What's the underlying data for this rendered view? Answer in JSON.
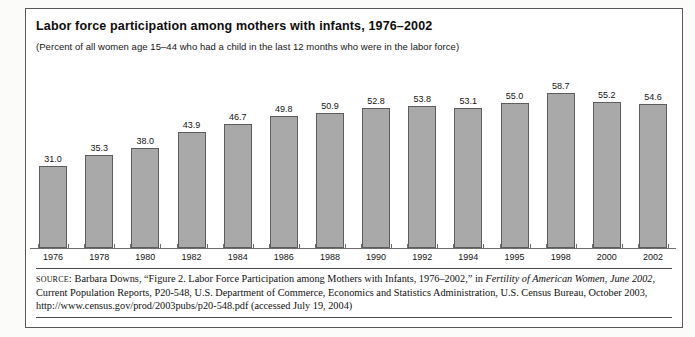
{
  "figure": {
    "title": "Labor force participation among mothers with infants, 1976–2002",
    "subtitle": "(Percent of all women age 15–44 who had a child in the last 12 months who were in the labor force)"
  },
  "source": {
    "label": "source:",
    "line1_a": " Barbara Downs, “Figure 2. Labor Force Participation among Mothers with Infants, 1976–2002,” in ",
    "line1_italic": "Fertility of American Women, June 2002",
    "line1_b": ",",
    "line2": "Current Population Reports, P20-548, U.S. Department of Commerce, Economics and Statistics Administration, U.S. Census Bureau, October 2003,",
    "line3": "http://www.census.gov/prod/2003pubs/p20-548.pdf (accessed July 19, 2004)"
  },
  "colors": {
    "bar_fill": "#a9a9a9",
    "bar_border": "#5d5d5d",
    "axis": "#6d6d6d",
    "frame": "#595959",
    "text": "#101010"
  },
  "chart_data": {
    "type": "bar",
    "title": "Labor force participation among mothers with infants, 1976–2002",
    "subtitle": "(Percent of all women age 15–44 who had a child in the last 12 months who were in the labor force)",
    "xlabel": "",
    "ylabel": "Percent",
    "ylim": [
      0,
      62
    ],
    "grid": false,
    "legend": "none",
    "categories": [
      "1976",
      "1978",
      "1980",
      "1982",
      "1984",
      "1986",
      "1988",
      "1990",
      "1992",
      "1994",
      "1995",
      "1998",
      "2000",
      "2002"
    ],
    "values": [
      31.0,
      35.3,
      38.0,
      43.9,
      46.7,
      49.8,
      50.9,
      52.8,
      53.8,
      53.1,
      55.0,
      58.7,
      55.2,
      54.6
    ],
    "value_labels": [
      "31.0",
      "35.3",
      "38.0",
      "43.9",
      "46.7",
      "49.8",
      "50.9",
      "52.8",
      "53.8",
      "53.1",
      "55.0",
      "58.7",
      "55.2",
      "54.6"
    ]
  }
}
